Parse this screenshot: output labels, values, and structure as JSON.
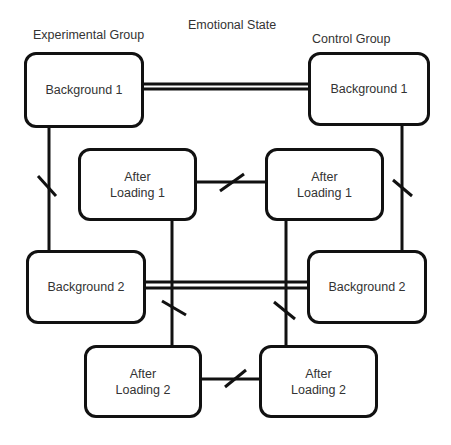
{
  "diagram": {
    "type": "flow/structure diagram",
    "headers": {
      "experimental": "Experimental Group",
      "emotional": "Emotional State",
      "control": "Control Group"
    },
    "nodes": {
      "bg1_exp": {
        "line1": "Background 1",
        "line2": ""
      },
      "bg1_ctl": {
        "line1": "Background 1",
        "line2": ""
      },
      "al1_exp": {
        "line1": "After",
        "line2": "Loading 1"
      },
      "al1_ctl": {
        "line1": "After",
        "line2": "Loading 1"
      },
      "bg2_exp": {
        "line1": "Background 2",
        "line2": ""
      },
      "bg2_ctl": {
        "line1": "Background 2",
        "line2": ""
      },
      "al2_exp": {
        "line1": "After",
        "line2": "Loading 2"
      },
      "al2_ctl": {
        "line1": "After",
        "line2": "Loading 2"
      }
    },
    "edges": [
      {
        "from": "bg1_exp",
        "to": "bg1_ctl",
        "style": "double"
      },
      {
        "from": "bg2_exp",
        "to": "bg2_ctl",
        "style": "double"
      },
      {
        "from": "al1_exp",
        "to": "al1_ctl",
        "style": "single-slashed"
      },
      {
        "from": "al2_exp",
        "to": "al2_ctl",
        "style": "single-slashed"
      },
      {
        "from": "bg1_exp",
        "to": "bg2_exp",
        "style": "single-slashed"
      },
      {
        "from": "bg1_ctl",
        "to": "bg2_ctl",
        "style": "single-slashed"
      },
      {
        "from": "al1_exp",
        "to": "al2_exp",
        "style": "single-slashed"
      },
      {
        "from": "al1_ctl",
        "to": "al2_ctl",
        "style": "single-slashed"
      }
    ],
    "colors": {
      "stroke": "#111111",
      "text": "#333333",
      "background": "#ffffff"
    }
  }
}
